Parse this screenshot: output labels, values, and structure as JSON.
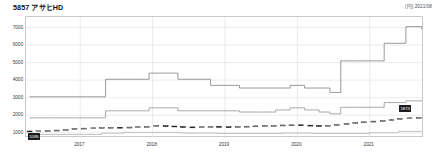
{
  "header": {
    "ticker": "5857",
    "company": "アサヒHD",
    "title": "5857 アサヒHD",
    "right_note": "(円) 2021/08"
  },
  "axes": {
    "y_labels": [
      "7000",
      "6000",
      "5000",
      "4000",
      "3000",
      "2000",
      "1000"
    ],
    "x_labels": [
      "2017",
      "2018",
      "2019",
      "2020",
      "2021"
    ]
  },
  "annotations": {
    "start_tag": "1095",
    "end_tag": "1873"
  },
  "chart_data": {
    "type": "line",
    "title": "5857 アサヒHD",
    "subtitle": "(円) 2021/08",
    "xlabel": "",
    "ylabel": "円",
    "ylim": [
      700,
      7600
    ],
    "xlim": [
      2016.25,
      2021.75
    ],
    "grid": true,
    "legend": "none",
    "x_tick_values": [
      2017,
      2018,
      2019,
      2020,
      2021
    ],
    "y_tick_values": [
      1000,
      2000,
      3000,
      4000,
      5000,
      6000,
      7000
    ],
    "series": [
      {
        "name": "上限バンド",
        "style": "step",
        "color": "#808080",
        "x": [
          2016.3,
          2016.6,
          2016.9,
          2017.1,
          2017.35,
          2017.6,
          2017.75,
          2017.95,
          2018.1,
          2018.35,
          2018.6,
          2018.8,
          2019.0,
          2019.2,
          2019.45,
          2019.7,
          2019.9,
          2020.1,
          2020.3,
          2020.45,
          2020.6,
          2020.8,
          2021.0,
          2021.2,
          2021.35,
          2021.5,
          2021.62,
          2021.72
        ],
        "values": [
          3050,
          3050,
          3050,
          3050,
          4050,
          4050,
          4050,
          4400,
          4400,
          4050,
          4050,
          3700,
          3700,
          3550,
          3550,
          3550,
          3700,
          3550,
          3550,
          3300,
          5100,
          5100,
          5100,
          6100,
          6100,
          7050,
          7050,
          6900
        ]
      },
      {
        "name": "下限バンド",
        "style": "step",
        "color": "#949494",
        "x": [
          2016.3,
          2016.6,
          2016.9,
          2017.1,
          2017.35,
          2017.6,
          2017.75,
          2017.95,
          2018.1,
          2018.35,
          2018.6,
          2018.8,
          2019.0,
          2019.2,
          2019.45,
          2019.7,
          2019.9,
          2020.1,
          2020.3,
          2020.45,
          2020.6,
          2020.8,
          2021.0,
          2021.2,
          2021.35,
          2021.5,
          2021.62,
          2021.72
        ],
        "values": [
          1850,
          1850,
          1850,
          1850,
          2250,
          2250,
          2250,
          2420,
          2420,
          2250,
          2250,
          2250,
          2250,
          2180,
          2180,
          2300,
          2420,
          2300,
          2180,
          2080,
          2450,
          2450,
          2450,
          2720,
          2720,
          2820,
          2820,
          2790
        ]
      },
      {
        "name": "株価(ローソク足)",
        "style": "candlestick",
        "color": "#111111",
        "x": [
          2016.3,
          2016.42,
          2016.55,
          2016.68,
          2016.8,
          2016.92,
          2017.05,
          2017.18,
          2017.3,
          2017.42,
          2017.55,
          2017.68,
          2017.8,
          2017.92,
          2018.05,
          2018.18,
          2018.3,
          2018.42,
          2018.55,
          2018.68,
          2018.8,
          2018.92,
          2019.05,
          2019.18,
          2019.3,
          2019.42,
          2019.55,
          2019.68,
          2019.8,
          2019.92,
          2020.05,
          2020.18,
          2020.3,
          2020.42,
          2020.55,
          2020.68,
          2020.8,
          2020.92,
          2021.05,
          2021.18,
          2021.3,
          2021.42,
          2021.55,
          2021.68
        ],
        "values": [
          1095,
          1110,
          1130,
          1150,
          1180,
          1230,
          1260,
          1280,
          1300,
          1310,
          1295,
          1320,
          1340,
          1360,
          1400,
          1380,
          1350,
          1330,
          1320,
          1340,
          1360,
          1340,
          1330,
          1350,
          1370,
          1390,
          1400,
          1420,
          1440,
          1450,
          1430,
          1410,
          1400,
          1420,
          1470,
          1520,
          1580,
          1620,
          1660,
          1700,
          1740,
          1800,
          1850,
          1873
        ],
        "open": [
          1100,
          1095,
          1112,
          1132,
          1152,
          1185,
          1235,
          1262,
          1282,
          1302,
          1312,
          1292,
          1322,
          1342,
          1362,
          1402,
          1382,
          1352,
          1332,
          1322,
          1342,
          1362,
          1342,
          1332,
          1352,
          1372,
          1392,
          1402,
          1422,
          1442,
          1452,
          1432,
          1412,
          1402,
          1422,
          1472,
          1522,
          1582,
          1622,
          1662,
          1702,
          1742,
          1802,
          1852
        ],
        "high": [
          1120,
          1125,
          1145,
          1165,
          1200,
          1250,
          1275,
          1300,
          1320,
          1330,
          1325,
          1345,
          1365,
          1385,
          1420,
          1415,
          1370,
          1350,
          1345,
          1365,
          1385,
          1370,
          1355,
          1375,
          1395,
          1415,
          1425,
          1445,
          1465,
          1475,
          1465,
          1435,
          1430,
          1450,
          1500,
          1555,
          1615,
          1655,
          1695,
          1735,
          1790,
          1840,
          1890,
          1910
        ],
        "low": [
          1075,
          1085,
          1100,
          1122,
          1140,
          1170,
          1220,
          1248,
          1268,
          1288,
          1275,
          1285,
          1310,
          1330,
          1350,
          1360,
          1335,
          1315,
          1305,
          1315,
          1330,
          1325,
          1315,
          1325,
          1340,
          1360,
          1380,
          1390,
          1410,
          1425,
          1415,
          1390,
          1385,
          1395,
          1410,
          1455,
          1505,
          1565,
          1605,
          1645,
          1685,
          1725,
          1785,
          1840
        ],
        "close": [
          1095,
          1110,
          1130,
          1150,
          1180,
          1230,
          1260,
          1280,
          1300,
          1310,
          1295,
          1320,
          1340,
          1360,
          1400,
          1380,
          1350,
          1330,
          1320,
          1340,
          1360,
          1340,
          1330,
          1350,
          1370,
          1390,
          1400,
          1420,
          1440,
          1450,
          1430,
          1410,
          1400,
          1420,
          1470,
          1520,
          1580,
          1620,
          1660,
          1700,
          1740,
          1800,
          1850,
          1873
        ]
      },
      {
        "name": "出来高系下段ライン",
        "style": "step",
        "color": "#b4b4b4",
        "x": [
          2016.3,
          2016.9,
          2017.3,
          2017.6,
          2018.0,
          2018.4,
          2018.9,
          2019.3,
          2019.8,
          2020.2,
          2020.6,
          2021.0,
          2021.4,
          2021.72
        ],
        "values": [
          900,
          900,
          980,
          1020,
          1020,
          980,
          960,
          960,
          980,
          960,
          960,
          1000,
          1080,
          1090
        ]
      }
    ],
    "annotations": [
      {
        "label": "1095",
        "x": 2016.3,
        "y": 1095,
        "position": "bottom-left"
      },
      {
        "label": "1873",
        "x": 2021.68,
        "y": 1873,
        "position": "above-right"
      }
    ]
  }
}
